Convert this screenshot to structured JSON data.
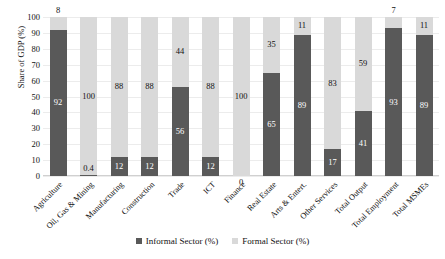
{
  "chart_data": {
    "type": "bar",
    "subtype": "stacked-100-percent",
    "title": "",
    "xlabel": "",
    "ylabel": "Share of GDP (%)",
    "ylim": [
      0,
      100
    ],
    "ytick_step": 10,
    "yticks": [
      "100",
      "90",
      "80",
      "70",
      "60",
      "50",
      "40",
      "30",
      "20",
      "10",
      "0"
    ],
    "grid": true,
    "legend_position": "bottom-center",
    "categories": [
      "Agriculture",
      "Oil, Gas & Mining",
      "Manufacturing",
      "Construction",
      "Trade",
      "ICT",
      "Finance",
      "Real Estate",
      "Arts & Entert.",
      "Other Services",
      "Total Output",
      "Total Employment",
      "Total MSMEs"
    ],
    "series": [
      {
        "name": "Informal Sector (%)",
        "color": "#595959",
        "values": [
          92,
          0.4,
          12,
          12,
          56,
          12,
          0,
          65,
          89,
          17,
          41,
          93,
          89
        ],
        "labels": [
          "92",
          "0.4",
          "12",
          "12",
          "56",
          "12",
          "0",
          "65",
          "89",
          "17",
          "41",
          "93",
          "89"
        ]
      },
      {
        "name": "Formal Sector (%)",
        "color": "#d9d9d9",
        "values": [
          8,
          100,
          88,
          88,
          44,
          88,
          100,
          35,
          11,
          83,
          59,
          7,
          11
        ],
        "labels": [
          "8",
          "100",
          "88",
          "88",
          "44",
          "88",
          "100",
          "35",
          "11",
          "83",
          "59",
          "7",
          "11"
        ]
      }
    ]
  },
  "legend": {
    "items": [
      {
        "label": "Informal Sector (%)",
        "swatch": "informal"
      },
      {
        "label": "Formal Sector (%)",
        "swatch": "formal"
      }
    ]
  }
}
